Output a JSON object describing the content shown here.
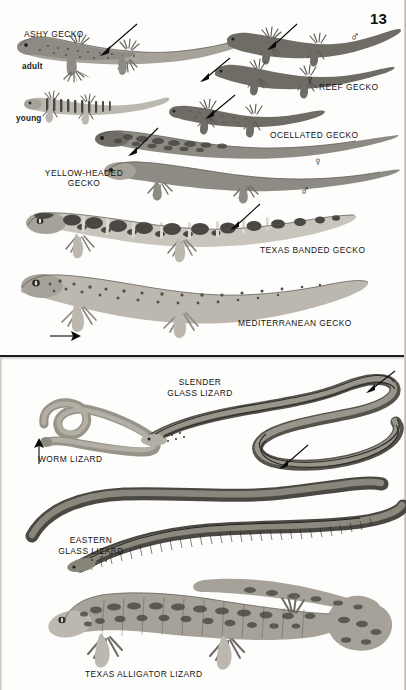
{
  "plate": {
    "page_number": "13",
    "background_color": "#fdfdfc",
    "ink_color": "#141414",
    "divider_color": "#1d1d1d"
  },
  "top_panel": {
    "name": "geckos",
    "labels": [
      {
        "key": "ashy_gecko",
        "text": "ASHY GECKO"
      },
      {
        "key": "adult",
        "text": "adult"
      },
      {
        "key": "young",
        "text": "young"
      },
      {
        "key": "reef_gecko",
        "text": "REEF GECKO"
      },
      {
        "key": "ocellated_gecko",
        "text": "OCELLATED GECKO"
      },
      {
        "key": "yellow_headed_l1",
        "text": "YELLOW-HEADED"
      },
      {
        "key": "yellow_headed_l2",
        "text": "GECKO"
      },
      {
        "key": "texas_banded",
        "text": "TEXAS BANDED GECKO"
      },
      {
        "key": "mediterranean",
        "text": "MEDITERRANEAN GECKO"
      }
    ],
    "sex_symbols": [
      {
        "key": "reef_male",
        "symbol": "♂"
      },
      {
        "key": "reef_female",
        "symbol": "♀"
      },
      {
        "key": "yellowheaded_female",
        "symbol": "♀"
      },
      {
        "key": "yellowheaded_male",
        "symbol": "♂"
      }
    ],
    "arrow_count": 7
  },
  "bottom_panel": {
    "name": "legless-and-alligator-lizards",
    "labels": [
      {
        "key": "slender_glass_l1",
        "text": "SLENDER"
      },
      {
        "key": "slender_glass_l2",
        "text": "GLASS LIZARD"
      },
      {
        "key": "worm_lizard",
        "text": "WORM LIZARD"
      },
      {
        "key": "eastern_glass_l1",
        "text": "EASTERN"
      },
      {
        "key": "eastern_glass_l2",
        "text": "GLASS LIZARD"
      },
      {
        "key": "texas_alligator",
        "text": "TEXAS ALLIGATOR LIZARD"
      }
    ],
    "arrow_count": 3
  }
}
